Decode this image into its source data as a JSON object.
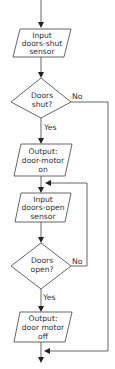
{
  "diagram": {
    "type": "flowchart",
    "nodes": [
      {
        "id": "in1",
        "shape": "parallelogram",
        "lines": [
          "Input",
          "doors-shut",
          "sensor"
        ]
      },
      {
        "id": "dec1",
        "shape": "diamond",
        "lines": [
          "Doors",
          "shut?"
        ]
      },
      {
        "id": "out1",
        "shape": "parallelogram",
        "lines": [
          "Output:",
          "door-motor",
          "on"
        ]
      },
      {
        "id": "in2",
        "shape": "parallelogram",
        "lines": [
          "Input",
          "doors-open",
          "sensor"
        ]
      },
      {
        "id": "dec2",
        "shape": "diamond",
        "lines": [
          "Doors",
          "open?"
        ]
      },
      {
        "id": "out2",
        "shape": "parallelogram",
        "lines": [
          "Output:",
          "door motor",
          "off"
        ]
      }
    ],
    "branches": {
      "dec1_no": "No",
      "dec1_yes": "Yes",
      "dec2_no": "No",
      "dec2_yes": "Yes"
    },
    "edges": [
      {
        "from": "start",
        "to": "in1"
      },
      {
        "from": "in1",
        "to": "dec1"
      },
      {
        "from": "dec1",
        "to": "out1",
        "label": "Yes"
      },
      {
        "from": "dec1",
        "to": "end",
        "label": "No"
      },
      {
        "from": "out1",
        "to": "in2"
      },
      {
        "from": "in2",
        "to": "dec2"
      },
      {
        "from": "dec2",
        "to": "in2",
        "label": "No"
      },
      {
        "from": "dec2",
        "to": "out2",
        "label": "Yes"
      },
      {
        "from": "out2",
        "to": "end"
      }
    ],
    "colors": {
      "stroke": "#555555",
      "arrow": "#222222",
      "text": "#333333",
      "background": "#ffffff"
    }
  }
}
